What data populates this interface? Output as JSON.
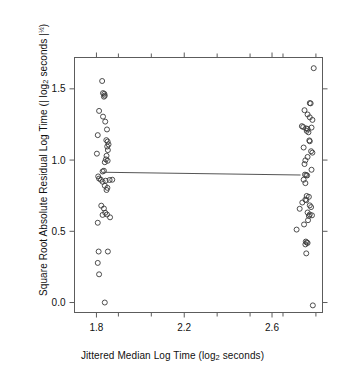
{
  "chart_data": {
    "type": "scatter",
    "title": "",
    "xlabel_parts": {
      "pre": "Jittered Median Log Time (log",
      "sub": "2",
      "post": " seconds)"
    },
    "ylabel_parts": {
      "pre": "Square Root Absolute Residual Log Time (| log",
      "sub": "2",
      "mid": " seconds |",
      "sup": "½",
      "post": ")"
    },
    "xlabel": "Jittered Median Log Time (log2 seconds)",
    "ylabel": "Square Root Absolute Residual Log Time (| log2 seconds |½)",
    "xlim": [
      1.7,
      2.83
    ],
    "ylim": [
      -0.07,
      1.72
    ],
    "xticks": [
      1.8,
      2.2,
      2.6
    ],
    "xticklabels": [
      "1.8",
      "2.2",
      "2.6"
    ],
    "xticks_minor": [
      1.9,
      2.0,
      2.1,
      2.3,
      2.4,
      2.5,
      2.7,
      2.8
    ],
    "yticks": [
      0.0,
      0.5,
      1.0,
      1.5
    ],
    "yticklabels": [
      "0.0",
      "0.5",
      "1.0",
      "1.5"
    ],
    "grid": false,
    "legend": null,
    "frame": "box-all-four-sides-outward-ticks",
    "marker": "open-circle",
    "marker_color": "#3a3a3a",
    "line_color": "#555555",
    "fit_line": {
      "label": "lowess-fit",
      "x": [
        1.83,
        2.73
      ],
      "y": [
        0.915,
        0.895
      ]
    },
    "series": [
      {
        "name": "left-group",
        "points": [
          [
            1.806,
            1.175
          ],
          [
            1.802,
            1.045
          ],
          [
            1.812,
            1.345
          ],
          [
            1.826,
            1.555
          ],
          [
            1.83,
            1.47
          ],
          [
            1.836,
            1.465
          ],
          [
            1.834,
            1.445
          ],
          [
            1.838,
            1.452
          ],
          [
            1.83,
            1.305
          ],
          [
            1.84,
            1.27
          ],
          [
            1.848,
            1.215
          ],
          [
            1.845,
            1.14
          ],
          [
            1.851,
            1.13
          ],
          [
            1.855,
            1.11
          ],
          [
            1.849,
            1.095
          ],
          [
            1.852,
            1.07
          ],
          [
            1.846,
            1.03
          ],
          [
            1.843,
            1.005
          ],
          [
            1.851,
            0.995
          ],
          [
            1.838,
            0.985
          ],
          [
            1.834,
            0.925
          ],
          [
            1.828,
            0.92
          ],
          [
            1.808,
            0.885
          ],
          [
            1.812,
            0.87
          ],
          [
            1.82,
            0.862
          ],
          [
            1.828,
            0.848
          ],
          [
            1.842,
            0.855
          ],
          [
            1.86,
            0.86
          ],
          [
            1.872,
            0.862
          ],
          [
            1.838,
            0.82
          ],
          [
            1.85,
            0.805
          ],
          [
            1.846,
            0.79
          ],
          [
            1.822,
            0.68
          ],
          [
            1.834,
            0.66
          ],
          [
            1.84,
            0.63
          ],
          [
            1.828,
            0.615
          ],
          [
            1.848,
            0.618
          ],
          [
            1.862,
            0.598
          ],
          [
            1.806,
            0.56
          ],
          [
            1.81,
            0.358
          ],
          [
            1.852,
            0.358
          ],
          [
            1.806,
            0.278
          ],
          [
            1.812,
            0.198
          ],
          [
            1.838,
            0.0
          ]
        ]
      },
      {
        "name": "right-group",
        "points": [
          [
            2.79,
            1.645
          ],
          [
            2.772,
            1.4
          ],
          [
            2.776,
            1.398
          ],
          [
            2.748,
            1.35
          ],
          [
            2.762,
            1.32
          ],
          [
            2.772,
            1.3
          ],
          [
            2.784,
            1.282
          ],
          [
            2.736,
            1.238
          ],
          [
            2.742,
            1.232
          ],
          [
            2.756,
            1.222
          ],
          [
            2.762,
            1.218
          ],
          [
            2.758,
            1.205
          ],
          [
            2.78,
            1.228
          ],
          [
            2.766,
            1.195
          ],
          [
            2.77,
            1.138
          ],
          [
            2.772,
            1.132
          ],
          [
            2.744,
            1.088
          ],
          [
            2.778,
            1.062
          ],
          [
            2.784,
            1.052
          ],
          [
            2.762,
            1.022
          ],
          [
            2.752,
            0.998
          ],
          [
            2.748,
            0.972
          ],
          [
            2.78,
            0.932
          ],
          [
            2.75,
            0.898
          ],
          [
            2.756,
            0.895
          ],
          [
            2.76,
            0.892
          ],
          [
            2.744,
            0.862
          ],
          [
            2.752,
            0.838
          ],
          [
            2.758,
            0.748
          ],
          [
            2.768,
            0.742
          ],
          [
            2.752,
            0.722
          ],
          [
            2.756,
            0.718
          ],
          [
            2.738,
            0.702
          ],
          [
            2.772,
            0.682
          ],
          [
            2.778,
            0.67
          ],
          [
            2.726,
            0.658
          ],
          [
            2.762,
            0.632
          ],
          [
            2.772,
            0.618
          ],
          [
            2.768,
            0.608
          ],
          [
            2.782,
            0.612
          ],
          [
            2.764,
            0.578
          ],
          [
            2.746,
            0.548
          ],
          [
            2.712,
            0.512
          ],
          [
            2.754,
            0.428
          ],
          [
            2.758,
            0.422
          ],
          [
            2.762,
            0.418
          ],
          [
            2.752,
            0.408
          ],
          [
            2.756,
            0.345
          ],
          [
            2.786,
            -0.02
          ]
        ]
      }
    ]
  }
}
